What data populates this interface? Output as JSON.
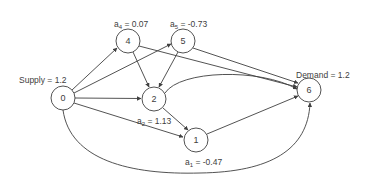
{
  "diagram": {
    "type": "flow-network",
    "colors": {
      "stroke": "#404040",
      "text": "#404040",
      "background": "#ffffff"
    },
    "nodes": [
      {
        "id": "0",
        "label": "0",
        "x": 63,
        "y": 98
      },
      {
        "id": "1",
        "label": "1",
        "x": 196,
        "y": 140
      },
      {
        "id": "2",
        "label": "2",
        "x": 154,
        "y": 99
      },
      {
        "id": "4",
        "label": "4",
        "x": 128,
        "y": 41
      },
      {
        "id": "5",
        "label": "5",
        "x": 183,
        "y": 41
      },
      {
        "id": "6",
        "label": "6",
        "x": 309,
        "y": 90
      }
    ],
    "edges": [
      {
        "from": "0",
        "to": "4"
      },
      {
        "from": "0",
        "to": "5"
      },
      {
        "from": "0",
        "to": "2"
      },
      {
        "from": "0",
        "to": "1"
      },
      {
        "from": "0",
        "to": "6",
        "curved": true
      },
      {
        "from": "4",
        "to": "2"
      },
      {
        "from": "4",
        "to": "6"
      },
      {
        "from": "5",
        "to": "2"
      },
      {
        "from": "5",
        "to": "6"
      },
      {
        "from": "2",
        "to": "1"
      },
      {
        "from": "2",
        "to": "6",
        "curved": true
      },
      {
        "from": "1",
        "to": "6"
      }
    ],
    "annotations": {
      "supply": {
        "text": "Supply = 1.2"
      },
      "demand": {
        "text": "Demand = 1.2"
      },
      "a4": {
        "var": "a",
        "sub": "4",
        "value": " = 0.07"
      },
      "a5": {
        "var": "a",
        "sub": "5",
        "value": " = -0.73"
      },
      "a2": {
        "var": "a",
        "sub": "2",
        "value": " = 1.13"
      },
      "a1": {
        "var": "a",
        "sub": "1",
        "value": " = -0.47"
      }
    }
  }
}
